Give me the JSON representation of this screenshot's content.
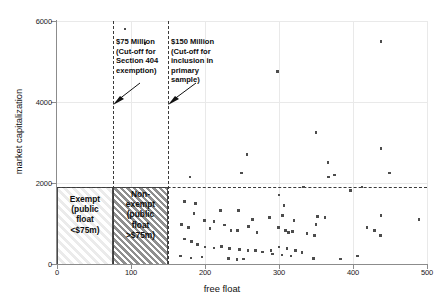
{
  "chart_data": {
    "type": "scatter",
    "title": "",
    "xlabel": "free float",
    "ylabel": "market capitalization",
    "xlim": [
      0,
      500
    ],
    "ylim": [
      0,
      6000
    ],
    "xticks": [
      0,
      100,
      200,
      300,
      400,
      500
    ],
    "yticks": [
      0,
      2000,
      4000,
      6000
    ],
    "grid": true,
    "legend": "none",
    "points": [
      {
        "x": 92,
        "y": 5800
      },
      {
        "x": 119,
        "y": 5450
      },
      {
        "x": 298,
        "y": 4750
      },
      {
        "x": 438,
        "y": 5500
      },
      {
        "x": 257,
        "y": 2700
      },
      {
        "x": 350,
        "y": 3250
      },
      {
        "x": 375,
        "y": 2200
      },
      {
        "x": 180,
        "y": 2150
      },
      {
        "x": 438,
        "y": 2850
      },
      {
        "x": 172,
        "y": 1550
      },
      {
        "x": 187,
        "y": 1500
      },
      {
        "x": 307,
        "y": 1450
      },
      {
        "x": 249,
        "y": 2250
      },
      {
        "x": 367,
        "y": 2150
      },
      {
        "x": 412,
        "y": 1900
      },
      {
        "x": 397,
        "y": 1820
      },
      {
        "x": 333,
        "y": 1900
      },
      {
        "x": 449,
        "y": 2250
      },
      {
        "x": 366,
        "y": 2500
      },
      {
        "x": 300,
        "y": 1700
      },
      {
        "x": 245,
        "y": 1320
      },
      {
        "x": 185,
        "y": 1250
      },
      {
        "x": 221,
        "y": 1320
      },
      {
        "x": 264,
        "y": 1100
      },
      {
        "x": 287,
        "y": 1150
      },
      {
        "x": 305,
        "y": 1200
      },
      {
        "x": 320,
        "y": 1080
      },
      {
        "x": 352,
        "y": 1180
      },
      {
        "x": 362,
        "y": 1150
      },
      {
        "x": 438,
        "y": 1200
      },
      {
        "x": 489,
        "y": 1100
      },
      {
        "x": 168,
        "y": 980
      },
      {
        "x": 178,
        "y": 900
      },
      {
        "x": 199,
        "y": 1080
      },
      {
        "x": 207,
        "y": 880
      },
      {
        "x": 212,
        "y": 1050
      },
      {
        "x": 226,
        "y": 960
      },
      {
        "x": 235,
        "y": 820
      },
      {
        "x": 244,
        "y": 830
      },
      {
        "x": 259,
        "y": 920
      },
      {
        "x": 270,
        "y": 780
      },
      {
        "x": 299,
        "y": 900
      },
      {
        "x": 309,
        "y": 820
      },
      {
        "x": 313,
        "y": 780
      },
      {
        "x": 318,
        "y": 800
      },
      {
        "x": 338,
        "y": 760
      },
      {
        "x": 348,
        "y": 700
      },
      {
        "x": 350,
        "y": 980
      },
      {
        "x": 419,
        "y": 900
      },
      {
        "x": 429,
        "y": 820
      },
      {
        "x": 437,
        "y": 700
      },
      {
        "x": 172,
        "y": 620
      },
      {
        "x": 182,
        "y": 560
      },
      {
        "x": 190,
        "y": 480
      },
      {
        "x": 200,
        "y": 420
      },
      {
        "x": 212,
        "y": 400
      },
      {
        "x": 222,
        "y": 430
      },
      {
        "x": 233,
        "y": 390
      },
      {
        "x": 247,
        "y": 360
      },
      {
        "x": 258,
        "y": 340
      },
      {
        "x": 268,
        "y": 330
      },
      {
        "x": 278,
        "y": 300
      },
      {
        "x": 289,
        "y": 330
      },
      {
        "x": 300,
        "y": 420
      },
      {
        "x": 311,
        "y": 380
      },
      {
        "x": 322,
        "y": 340
      },
      {
        "x": 331,
        "y": 290
      },
      {
        "x": 291,
        "y": 250
      },
      {
        "x": 304,
        "y": 220
      },
      {
        "x": 316,
        "y": 200
      },
      {
        "x": 167,
        "y": 200
      },
      {
        "x": 181,
        "y": 150
      },
      {
        "x": 196,
        "y": 170
      },
      {
        "x": 232,
        "y": 130
      },
      {
        "x": 243,
        "y": 110
      },
      {
        "x": 252,
        "y": 120
      },
      {
        "x": 347,
        "y": 140
      },
      {
        "x": 383,
        "y": 120
      },
      {
        "x": 406,
        "y": 200
      }
    ],
    "reference_lines": {
      "vertical": [
        {
          "x": 75,
          "label": "$75 Million"
        },
        {
          "x": 150,
          "label": "$150 Million"
        }
      ],
      "horizontal": [
        {
          "y": 1900
        }
      ]
    }
  },
  "annotations": {
    "callout_75": "$75 Million\n(Cut-off for\nSection 404\nexemption)",
    "callout_150": "$150 Million\n(Cut-off for\ninclusion in\nprimary sample)"
  },
  "regions": {
    "exempt": "Exempt\n(public\nfloat\n<$75m)",
    "nonexempt": "Non-\nexempt\n(public\nfloat\n>$75m)"
  },
  "axis": {
    "y_title": "market capitalization",
    "x_title": "free float",
    "y_ticks": [
      "0",
      "2000",
      "4000",
      "6000"
    ],
    "x_ticks": [
      "0",
      "100",
      "200",
      "300",
      "400",
      "500"
    ]
  },
  "colors": {
    "point": "#4d4d4d",
    "axis": "#8c8c8c",
    "grid": "#e9e9e9",
    "dash": "#3a3a3a"
  }
}
